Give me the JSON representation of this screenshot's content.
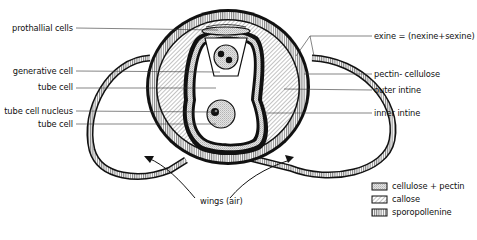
{
  "diagram": {
    "labels_left": [
      {
        "id": "prothallial-cells",
        "text": "prothallial cells"
      },
      {
        "id": "generative-cell",
        "text": "generative cell"
      },
      {
        "id": "tube-cell-1",
        "text": "tube cell"
      },
      {
        "id": "tube-cell-nucleus",
        "text": "tube cell nucleus"
      },
      {
        "id": "tube-cell-2",
        "text": "tube cell"
      }
    ],
    "labels_right": [
      {
        "id": "exine",
        "text": "exine = (nexine+sexine)"
      },
      {
        "id": "pectin-cellulose",
        "text": "pectin- cellulose"
      },
      {
        "id": "outer-intine",
        "text": "outer intine"
      },
      {
        "id": "inner-intine",
        "text": "inner intine"
      }
    ],
    "bottom_label": "wings (air)",
    "legend": [
      {
        "pattern": "stipple",
        "text": "cellulose + pectin"
      },
      {
        "pattern": "diagonal-hatch",
        "text": "callose"
      },
      {
        "pattern": "vertical-hatch",
        "text": "sporopollenine"
      }
    ]
  }
}
